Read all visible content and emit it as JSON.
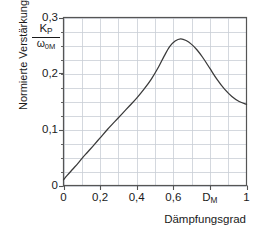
{
  "chart_data": {
    "type": "line",
    "title": "",
    "subtitle": "",
    "ylabel": "Normierte Verstärkung",
    "ylabel_fraction": {
      "numerator": "K",
      "numerator_sub": "P",
      "denominator": "ω",
      "denominator_sub": "0M"
    },
    "xlabel": "Dämpfungsgrad",
    "xlim": [
      0,
      1
    ],
    "ylim": [
      0,
      0.3
    ],
    "xticks": [
      0,
      0.2,
      0.4,
      0.6,
      0.8,
      1
    ],
    "xticklabels": [
      "0",
      "0,2",
      "0,4",
      "0,6",
      "D_M",
      "1"
    ],
    "xtick_annotation": {
      "base": "D",
      "sub": "M",
      "at_value": 0.8
    },
    "yticks": [
      0,
      0.1,
      0.2,
      0.3
    ],
    "yticklabels": [
      "0",
      "0,1",
      "0,2",
      "0,3"
    ],
    "grid": true,
    "grid_x_step": 0.1,
    "grid_y_step": 0.025,
    "legend": "none",
    "series": [
      {
        "name": "Normierte Verstärkung",
        "color": "#3a3a3a",
        "x": [
          0.0,
          0.02,
          0.05,
          0.08,
          0.1,
          0.13,
          0.16,
          0.2,
          0.24,
          0.28,
          0.32,
          0.36,
          0.4,
          0.44,
          0.48,
          0.52,
          0.55,
          0.58,
          0.61,
          0.64,
          0.67,
          0.7,
          0.73,
          0.76,
          0.8,
          0.84,
          0.88,
          0.92,
          0.96,
          1.0
        ],
        "y": [
          0.01,
          0.018,
          0.029,
          0.04,
          0.048,
          0.059,
          0.07,
          0.085,
          0.1,
          0.114,
          0.128,
          0.142,
          0.156,
          0.172,
          0.19,
          0.212,
          0.231,
          0.248,
          0.258,
          0.262,
          0.259,
          0.252,
          0.242,
          0.229,
          0.209,
          0.189,
          0.172,
          0.159,
          0.15,
          0.145
        ]
      }
    ],
    "peak": {
      "x": 0.62,
      "y": 0.262
    },
    "endpoint": {
      "x": 1.0,
      "y": 0.145
    },
    "startpoint": {
      "x": 0.0,
      "y": 0.01
    }
  },
  "colors": {
    "curve": "#3a3a3a",
    "axis": "#555555",
    "grid": "#c9ced6",
    "text": "#1a1a1a",
    "background": "#ffffff"
  }
}
